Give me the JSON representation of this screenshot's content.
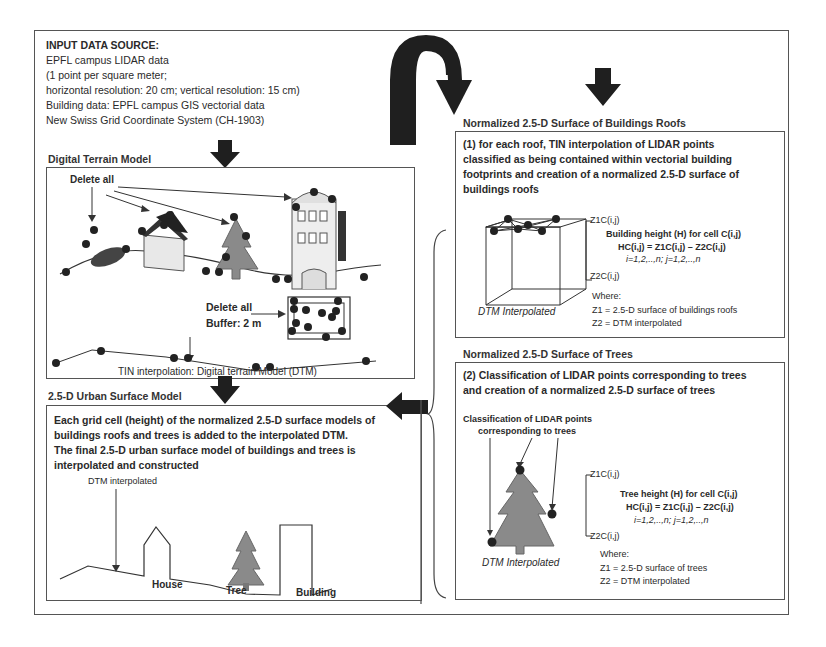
{
  "input_source": {
    "heading": "INPUT DATA SOURCE:",
    "lines": [
      "EPFL campus LIDAR data",
      "(1 point per square meter;",
      "horizontal resolution:  20 cm; vertical resolution: 15 cm)",
      "Building data: EPFL campus GIS vectorial data",
      "New Swiss Grid Coordinate System (CH-1903)"
    ]
  },
  "dtm": {
    "title": "Digital Terrain Model",
    "delete_all_top": "Delete all",
    "delete_all_buffer": "Delete all",
    "buffer": "Buffer: 2 m",
    "hotel_sign": "HOTEL",
    "caption": "TIN interpolation: Digital terrain Model (DTM)"
  },
  "urban": {
    "title": "2.5-D Urban Surface Model",
    "description": [
      "Each grid cell (height) of the normalized 2.5-D surface models of",
      "buildings roofs and trees is added to the interpolated DTM.",
      "The final 2.5-D urban surface model of buildings and trees is",
      "interpolated and constructed"
    ],
    "dtm_label": "DTM interpolated",
    "labels": {
      "house": "House",
      "tree": "Tree",
      "building": "Building"
    }
  },
  "roofs": {
    "title": "Normalized 2.5-D Surface of Buildings Roofs",
    "description": [
      "(1) for each roof, TIN interpolation of LIDAR points",
      "classified as being contained within vectorial building",
      "footprints and creation of a normalized 2.5-D surface of",
      "buildings roofs"
    ],
    "z1": "Z1C(i,j)",
    "z2": "Z2C(i,j)",
    "formula_title": "Building height  (H)  for cell C(i,j)",
    "formula": "HC(i,j) =  Z1C(i,j) – Z2C(i,j)",
    "indices": "i=1,2,..,n; j=1,2,..,n",
    "dtm_caption": "DTM Interpolated",
    "where": "Where:",
    "z1_def": "Z1 = 2.5-D surface of buildings roofs",
    "z2_def": "Z2 = DTM interpolated"
  },
  "trees": {
    "title": "Normalized 2.5-D Surface of Trees",
    "description": [
      "(2) Classification of LIDAR points corresponding to trees",
      "and creation of a normalized 2.5-D surface of trees"
    ],
    "classification_label": [
      "Classification of LIDAR points",
      "corresponding to trees"
    ],
    "z1": "Z1C(i,j)",
    "z2": "Z2C(i,j)",
    "formula_title": "Tree height  (H)  for cell C(i,j)",
    "formula": "HC(i,j) =  Z1C(i,j) – Z2C(i,j)",
    "indices": "i=1,2,..,n; j=1,2,..,n",
    "dtm_caption": "DTM Interpolated",
    "where": "Where:",
    "z1_def": "Z1 = 2.5-D surface of trees",
    "z2_def": "Z2 = DTM interpolated"
  },
  "colors": {
    "frame": "#555555",
    "arrow": "#1f1f1f",
    "tree_fill": "#8a8a8a",
    "point": "#222222"
  }
}
